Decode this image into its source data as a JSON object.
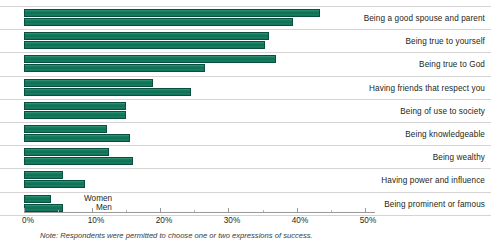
{
  "chart_data": {
    "type": "bar",
    "orientation": "horizontal",
    "title": "",
    "subtitle": "",
    "xlabel": "",
    "ylabel": "",
    "xlim": [
      0,
      51.5
    ],
    "grid": false,
    "legend_position": "inside-bottom-left",
    "note": "Note: Respondents were permitted to choose one or two expressions of success.",
    "categories": [
      "Being a good spouse and parent",
      "Being true to yourself",
      "Being true to God",
      "Having friends that respect you",
      "Being of use to society",
      "Being knowledgeable",
      "Being wealthy",
      "Having power and influence",
      "Being prominent or famous"
    ],
    "series": [
      {
        "name": "Women",
        "values": [
          43.5,
          36.0,
          37.0,
          19.0,
          15.0,
          12.2,
          12.4,
          5.7,
          4.0
        ]
      },
      {
        "name": "Men",
        "values": [
          39.4,
          35.4,
          26.6,
          24.5,
          15.0,
          15.5,
          16.0,
          9.0,
          5.7
        ]
      }
    ],
    "axis": {
      "tick_values": [
        0,
        10,
        20,
        30,
        40,
        50
      ],
      "tick_labels": [
        "0%",
        "10%",
        "20%",
        "30%",
        "40%",
        "50%"
      ],
      "minor_tick_values": [
        5,
        15,
        25,
        35,
        45
      ]
    },
    "colors": {
      "bar_fill": "#0f6f55",
      "bar_highlight": "#3f9b7e",
      "bar_border": "#0a4f3e",
      "axis": "#9a9a9a",
      "row_divider": "#d4d4d4",
      "text": "#231f20",
      "note_text": "#3a3a3a"
    }
  }
}
